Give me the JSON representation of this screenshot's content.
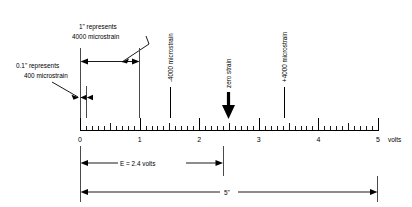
{
  "figure": {
    "units_label": "volts",
    "callouts": {
      "inch_scale_line1": "1\" represents",
      "inch_scale_line2": "4000 microstrain",
      "tenth_inch_line1": "0.1\" represents",
      "tenth_inch_line2": "400 microstrain"
    },
    "markers": [
      {
        "name": "minus-4000",
        "label": "-4000 microstrain",
        "volts": 1.5
      },
      {
        "name": "zero-strain",
        "label": "zero strain",
        "volts": 2.45
      },
      {
        "name": "plus-4000",
        "label": "+4000 microstrain",
        "volts": 3.4
      }
    ],
    "dimensions": {
      "voltage_label": "E = 2.4 volts",
      "voltage_value": 2.4,
      "total_length_label": "5\"",
      "total_length_value": 5
    }
  },
  "chart_data": {
    "type": "scale-ruler",
    "xlabel": "volts",
    "xlim": [
      0,
      5
    ],
    "major_tick_interval": 1,
    "minor_tick_interval": 0.1,
    "half_tick_interval": 0.5,
    "tick_labels": [
      "0",
      "1",
      "2",
      "3",
      "4",
      "5"
    ],
    "tick_values": [
      0,
      1,
      2,
      3,
      4,
      5
    ],
    "grid": false,
    "legend": "none",
    "annotations": [
      {
        "text": "-4000 microstrain",
        "x": 1.5,
        "orientation": "vertical"
      },
      {
        "text": "zero strain",
        "x": 2.45,
        "orientation": "vertical",
        "arrow": "down"
      },
      {
        "text": "+4000 microstrain",
        "x": 3.4,
        "orientation": "vertical"
      },
      {
        "text": "1\" represents 4000 microstrain",
        "x_range": [
          0,
          1
        ],
        "orientation": "horizontal"
      },
      {
        "text": "0.1\" represents 400 microstrain",
        "x_range": [
          0,
          0.1
        ],
        "orientation": "horizontal"
      },
      {
        "text": "E = 2.4 volts",
        "x_range": [
          0,
          2.4
        ],
        "orientation": "horizontal"
      },
      {
        "text": "5\"",
        "x_range": [
          0,
          5
        ],
        "orientation": "horizontal"
      }
    ],
    "scale_factor": {
      "inches_per_volt": 1,
      "microstrain_per_inch": 4000,
      "microstrain_per_tenth_inch": 400
    }
  },
  "tick_numbers": [
    {
      "label": "0",
      "x": 80
    },
    {
      "label": "1",
      "x": 139.6
    },
    {
      "label": "2",
      "x": 199.2
    },
    {
      "label": "3",
      "x": 258.8
    },
    {
      "label": "4",
      "x": 318.4
    },
    {
      "label": "5",
      "x": 378
    }
  ]
}
